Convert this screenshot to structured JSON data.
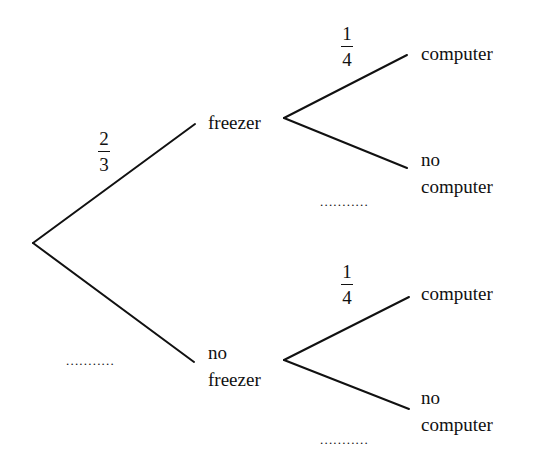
{
  "diagram": {
    "type": "probability-tree",
    "stage1": {
      "freezer": {
        "label": "freezer",
        "probability": {
          "numerator": "2",
          "denominator": "3"
        }
      },
      "no_freezer": {
        "label_line1": "no",
        "label_line2": "freezer",
        "probability_blank": "..........."
      }
    },
    "stage2_upper": {
      "computer": {
        "label": "computer",
        "probability": {
          "numerator": "1",
          "denominator": "4"
        }
      },
      "no_computer": {
        "label_line1": "no",
        "label_line2": "computer",
        "probability_blank": "..........."
      }
    },
    "stage2_lower": {
      "computer": {
        "label": "computer",
        "probability": {
          "numerator": "1",
          "denominator": "4"
        }
      },
      "no_computer": {
        "label_line1": "no",
        "label_line2": "computer",
        "probability_blank": "..........."
      }
    },
    "line_color": "#111111"
  }
}
